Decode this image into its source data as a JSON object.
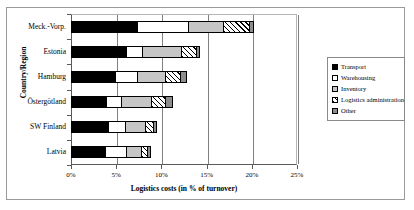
{
  "chart_data": {
    "type": "bar",
    "orientation": "horizontal",
    "stacked": true,
    "title": "",
    "xlabel": "Logistics costs (in % of turnover)",
    "ylabel": "Country/Region",
    "xlim": [
      0,
      25
    ],
    "xticks": [
      "0%",
      "5%",
      "10%",
      "15%",
      "20%",
      "25%"
    ],
    "xtick_values": [
      0,
      5,
      10,
      15,
      20,
      25
    ],
    "grid": true,
    "grid_axis": "x",
    "legend_position": "right",
    "categories": [
      "Meck.-Vorp.",
      "Estonia",
      "Hamburg",
      "Östergötland",
      "SW Finland",
      "Latvia"
    ],
    "series": [
      {
        "name": "Transport",
        "color": "#000000",
        "pattern": "solid-black",
        "values": [
          7.3,
          6.1,
          4.9,
          3.9,
          4.1,
          3.8
        ]
      },
      {
        "name": "Warehousing",
        "color": "#ffffff",
        "pattern": "solid-white",
        "values": [
          5.6,
          1.7,
          2.4,
          1.6,
          1.9,
          2.3
        ]
      },
      {
        "name": "Inventory",
        "color": "#c6c6c6",
        "pattern": "light-gray",
        "values": [
          3.9,
          4.4,
          3.1,
          3.3,
          2.2,
          1.7
        ]
      },
      {
        "name": "Logistics administration",
        "color": "#000000",
        "pattern": "diagonal-hatch",
        "values": [
          2.9,
          1.6,
          1.7,
          1.6,
          0.9,
          0.6
        ]
      },
      {
        "name": "Other",
        "color": "#8c8c8c",
        "pattern": "dark-gray",
        "values": [
          0.6,
          0.5,
          0.7,
          0.9,
          0.4,
          0.4
        ]
      }
    ],
    "totals": [
      20.3,
      14.3,
      12.8,
      11.3,
      9.5,
      8.8
    ]
  },
  "legend": {
    "items": [
      {
        "label": "Transport"
      },
      {
        "label": "Warehousing"
      },
      {
        "label": "Inventory"
      },
      {
        "label": "Logistics administration"
      },
      {
        "label": "Other"
      }
    ]
  }
}
